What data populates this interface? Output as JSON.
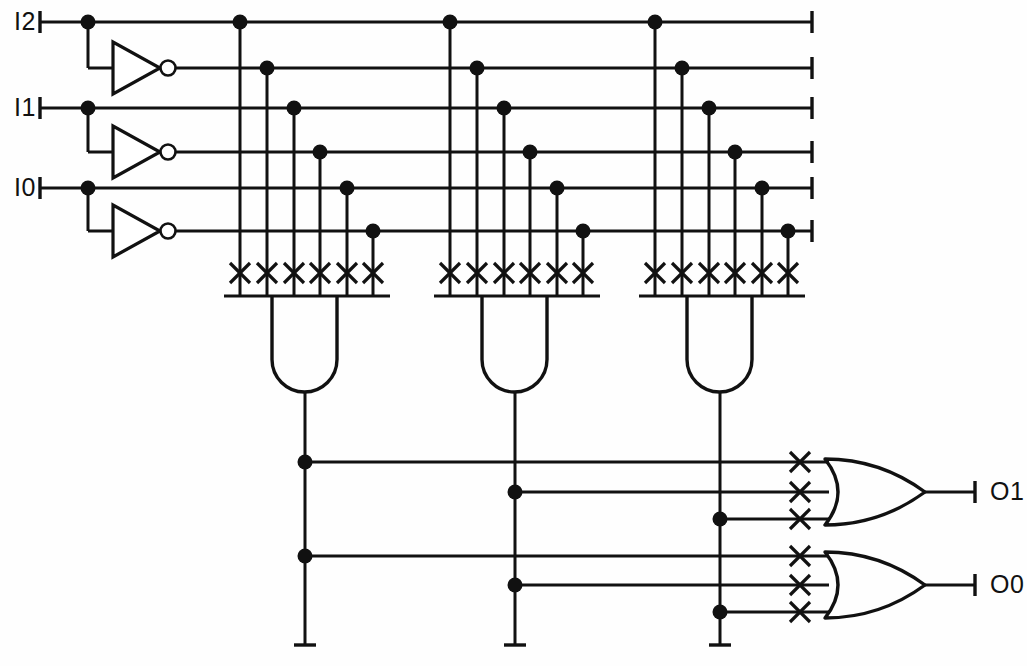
{
  "diagram": {
    "kind": "programmable-logic-array",
    "ink_color": "#111111",
    "background_color": "#fefefe",
    "width": 1027,
    "height": 666
  },
  "inputs": [
    {
      "id": "i2",
      "label": "I2",
      "y": 22,
      "stub_x": 40,
      "tap_x": 88,
      "true_rail_y": 22,
      "inv_rail_y": 68
    },
    {
      "id": "i1",
      "label": "I1",
      "y": 108,
      "stub_x": 40,
      "tap_x": 88,
      "true_rail_y": 108,
      "inv_rail_y": 152
    },
    {
      "id": "i0",
      "label": "I0",
      "y": 188,
      "stub_x": 40,
      "tap_x": 88,
      "true_rail_y": 188,
      "inv_rail_y": 231
    }
  ],
  "inverters": [
    {
      "id": "inv2",
      "input_label": "I2",
      "output_rail_y": 68,
      "x": 110,
      "y": 68
    },
    {
      "id": "inv1",
      "input_label": "I1",
      "output_rail_y": 152,
      "x": 110,
      "y": 152
    },
    {
      "id": "inv0",
      "input_label": "I0",
      "output_rail_y": 231,
      "x": 110,
      "y": 231
    }
  ],
  "rails": {
    "names": [
      "I2",
      "notI2",
      "I1",
      "notI1",
      "I0",
      "notI0"
    ],
    "y": [
      22,
      68,
      108,
      152,
      188,
      231
    ],
    "x_start": 40,
    "x_end": 812,
    "terminator_x": 812
  },
  "and_planes": [
    {
      "id": "and-term-0",
      "name": "product-term-0",
      "bus_y": 296,
      "bus_x1": 224,
      "bus_x2": 390,
      "gate_left": 272,
      "gate_right": 337,
      "gate_bottom": 392,
      "out_x": 305,
      "out_bottom": 645,
      "columns_x": [
        240,
        267,
        294,
        320,
        347,
        373
      ],
      "cross_y": 273,
      "connection_count": 6
    },
    {
      "id": "and-term-1",
      "name": "product-term-1",
      "bus_y": 296,
      "bus_x1": 434,
      "bus_x2": 600,
      "gate_left": 482,
      "gate_right": 547,
      "gate_bottom": 392,
      "out_x": 515,
      "out_bottom": 645,
      "columns_x": [
        450,
        477,
        504,
        530,
        557,
        583
      ],
      "cross_y": 273,
      "connection_count": 6
    },
    {
      "id": "and-term-2",
      "name": "product-term-2",
      "bus_y": 296,
      "bus_x1": 639,
      "bus_x2": 805,
      "gate_left": 687,
      "gate_right": 752,
      "gate_bottom": 392,
      "out_x": 720,
      "out_bottom": 645,
      "columns_x": [
        655,
        682,
        709,
        735,
        762,
        788
      ],
      "cross_y": 273,
      "connection_count": 6
    }
  ],
  "or_planes": [
    {
      "id": "or-gate-o1",
      "output_label": "O1",
      "body_left": 825,
      "body_right": 925,
      "center_y": 492,
      "half_height": 33,
      "out_x_end": 975,
      "label_x": 985,
      "input_lines": [
        {
          "y": 462,
          "from_term": "product-term-0",
          "x_start": 305,
          "cross_x": 800,
          "dot": true
        },
        {
          "y": 492,
          "from_term": "product-term-1",
          "x_start": 515,
          "cross_x": 800,
          "dot": true
        },
        {
          "y": 519,
          "from_term": "product-term-2",
          "x_start": 720,
          "cross_x": 800,
          "dot": true
        }
      ]
    },
    {
      "id": "or-gate-o0",
      "output_label": "O0",
      "body_left": 825,
      "body_right": 925,
      "center_y": 585,
      "half_height": 33,
      "out_x_end": 975,
      "label_x": 985,
      "input_lines": [
        {
          "y": 556,
          "from_term": "product-term-0",
          "x_start": 305,
          "cross_x": 800,
          "dot": true
        },
        {
          "y": 585,
          "from_term": "product-term-1",
          "x_start": 515,
          "cross_x": 800,
          "dot": true
        },
        {
          "y": 612,
          "from_term": "product-term-2",
          "x_start": 720,
          "cross_x": 800,
          "dot": true
        }
      ]
    }
  ],
  "outputs": [
    {
      "id": "o1",
      "label": "O1",
      "y": 492
    },
    {
      "id": "o0",
      "label": "O0",
      "y": 585
    }
  ],
  "legend": {
    "cross_meaning": "programmed connection",
    "dot_meaning": "wire junction"
  }
}
